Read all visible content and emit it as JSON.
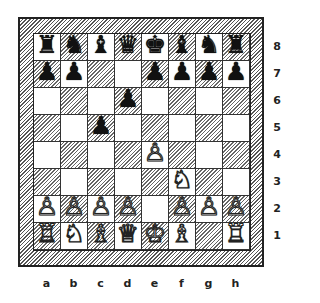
{
  "diagram": {
    "type": "chess-position",
    "files": [
      "a",
      "b",
      "c",
      "d",
      "e",
      "f",
      "g",
      "h"
    ],
    "ranks": [
      "8",
      "7",
      "6",
      "5",
      "4",
      "3",
      "2",
      "1"
    ],
    "board": [
      [
        "br",
        "bn",
        "bb",
        "bq",
        "bk",
        "bb",
        "bn",
        "br"
      ],
      [
        "bp",
        "bp",
        "",
        "",
        "bp",
        "bp",
        "bp",
        "bp"
      ],
      [
        "",
        "",
        "",
        "bp",
        "",
        "",
        "",
        ""
      ],
      [
        "",
        "",
        "bp",
        "",
        "",
        "",
        "",
        ""
      ],
      [
        "",
        "",
        "",
        "",
        "wp",
        "",
        "",
        ""
      ],
      [
        "",
        "",
        "",
        "",
        "",
        "wn",
        "",
        ""
      ],
      [
        "wp",
        "wp",
        "wp",
        "wp",
        "",
        "wp",
        "wp",
        "wp"
      ],
      [
        "wr",
        "wn",
        "wb",
        "wq",
        "wk",
        "wb",
        "",
        "wr"
      ]
    ],
    "glyphs": {
      "wk": "♔",
      "wq": "♕",
      "wr": "♖",
      "wb": "♗",
      "wn": "♘",
      "wp": "♙",
      "bk": "♚",
      "bq": "♛",
      "br": "♜",
      "bb": "♝",
      "bn": "♞",
      "bp": "♟"
    }
  }
}
